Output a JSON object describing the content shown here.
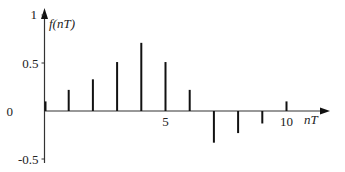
{
  "chart_data": {
    "type": "stem",
    "title": "",
    "xlabel": "nT",
    "ylabel": "f(nT)",
    "x": [
      0,
      1,
      2,
      3,
      4,
      5,
      6,
      7,
      8,
      9,
      10
    ],
    "values": [
      0.1,
      0.22,
      0.33,
      0.51,
      0.71,
      0.51,
      0.22,
      -0.33,
      -0.23,
      -0.13,
      0.1
    ],
    "xlim": [
      0,
      12
    ],
    "ylim": [
      -0.5,
      1
    ],
    "x_ticks": [
      {
        "value": 5,
        "label": "5"
      },
      {
        "value": 10,
        "label": "10"
      }
    ],
    "y_ticks": [
      {
        "value": 1,
        "label": "1"
      },
      {
        "value": 0.5,
        "label": "0.5"
      },
      {
        "value": 0,
        "label": "0"
      },
      {
        "value": -0.5,
        "label": "-0.5"
      }
    ],
    "grid": false,
    "legend": null,
    "colors": {
      "stem": "#111111",
      "axis": "#333333"
    }
  },
  "labels": {
    "y_axis": {
      "f": "f",
      "open": "(",
      "n": "nT",
      "close": ")"
    },
    "x_axis": "nT"
  }
}
